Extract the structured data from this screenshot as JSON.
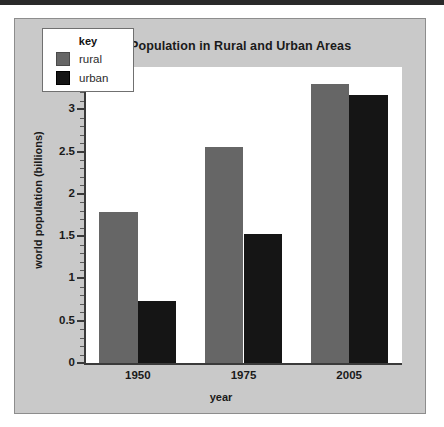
{
  "chart_data": {
    "type": "bar",
    "title": "World Population in Rural and Urban Areas",
    "xlabel": "year",
    "ylabel": "world population (billions)",
    "categories": [
      "1950",
      "1975",
      "2005"
    ],
    "series": [
      {
        "name": "rural",
        "color": "#666666",
        "values": [
          1.79,
          2.55,
          3.3
        ]
      },
      {
        "name": "urban",
        "color": "#151515",
        "values": [
          0.73,
          1.52,
          3.17
        ]
      }
    ],
    "ylim": [
      0,
      3.5
    ],
    "yticks": [
      "0",
      "0.5",
      "1",
      "1.5",
      "2",
      "2.5",
      "3",
      "3.5"
    ],
    "ytick_values": [
      0,
      0.5,
      1,
      1.5,
      2,
      2.5,
      3,
      3.5
    ],
    "minor_tick_step": 0.1,
    "grid": false,
    "legend": {
      "title": "key",
      "position": "top-left",
      "entries": [
        "rural",
        "urban"
      ]
    }
  },
  "legend": {
    "title": "key",
    "rural_label": "rural",
    "urban_label": "urban"
  },
  "axes": {
    "title": "World Population in Rural and Urban Areas",
    "x_title": "year",
    "y_title": "world population (billions)"
  },
  "colors": {
    "rural": "#666666",
    "urban": "#151515",
    "panel": "#c9c9c9",
    "plot_background": "#ffffff",
    "axis": "#3a3a3a"
  }
}
